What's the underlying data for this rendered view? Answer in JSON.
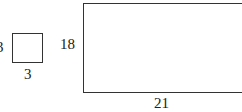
{
  "diagram": {
    "small_square": {
      "side_label": "3",
      "bottom_label": "3"
    },
    "large_rectangle": {
      "side_label": "18",
      "bottom_label": "21"
    }
  }
}
